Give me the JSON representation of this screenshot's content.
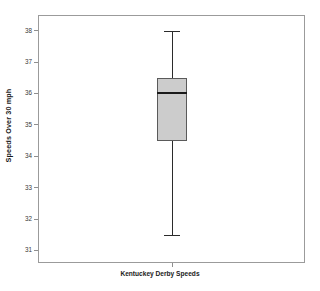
{
  "chart_data": {
    "type": "box",
    "title": "",
    "xlabel": "Kentuckey Derby Speeds",
    "ylabel": "Speeds Over 30 mph",
    "categories": [
      "Kentuckey Derby Speeds"
    ],
    "yticks": [
      31,
      32,
      33,
      34,
      35,
      36,
      37,
      38
    ],
    "ytick_labels": [
      "31",
      "32",
      "33",
      "34",
      "35",
      "36",
      "37",
      "38"
    ],
    "ylim": [
      30.6,
      38.5
    ],
    "grid": false,
    "legend": null,
    "boxes": [
      {
        "name": "Kentuckey Derby Speeds",
        "min": 31.5,
        "q1": 34.5,
        "median": 36.0,
        "q3": 36.5,
        "max": 38.0,
        "outliers": [],
        "fill_color": "#cccccc",
        "edge_color": "#5a5a5a",
        "median_color": "#1a1a1a",
        "whisker_color": "#2b2b2b"
      }
    ],
    "frame_color": "#9b9b9b",
    "background_color": "#ffffff"
  }
}
